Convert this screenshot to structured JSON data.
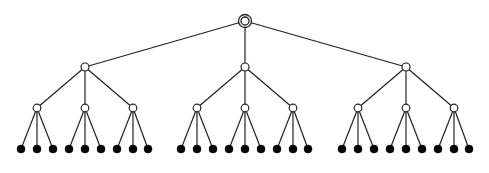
{
  "diagram": {
    "type": "tree",
    "colors": {
      "edge": "#222222",
      "open_node_fill": "#ffffff",
      "open_node_stroke": "#222222",
      "leaf_fill": "#000000",
      "background": "#ffffff"
    },
    "root": {
      "x": 245,
      "y": 21,
      "style": "double-ring"
    },
    "level1": [
      {
        "x": 85,
        "y": 67
      },
      {
        "x": 245,
        "y": 67
      },
      {
        "x": 406,
        "y": 67
      }
    ],
    "level2": [
      {
        "x": 37,
        "y": 108,
        "parent": 0
      },
      {
        "x": 85,
        "y": 108,
        "parent": 0
      },
      {
        "x": 133,
        "y": 108,
        "parent": 0
      },
      {
        "x": 197,
        "y": 108,
        "parent": 1
      },
      {
        "x": 245,
        "y": 108,
        "parent": 1
      },
      {
        "x": 293,
        "y": 108,
        "parent": 1
      },
      {
        "x": 358,
        "y": 108,
        "parent": 2
      },
      {
        "x": 406,
        "y": 108,
        "parent": 2
      },
      {
        "x": 454,
        "y": 108,
        "parent": 2
      }
    ],
    "leaves": [
      {
        "x": 21,
        "y": 149,
        "parent": 0
      },
      {
        "x": 37,
        "y": 149,
        "parent": 0
      },
      {
        "x": 53,
        "y": 149,
        "parent": 0
      },
      {
        "x": 69,
        "y": 149,
        "parent": 1
      },
      {
        "x": 85,
        "y": 149,
        "parent": 1
      },
      {
        "x": 101,
        "y": 149,
        "parent": 1
      },
      {
        "x": 117,
        "y": 149,
        "parent": 2
      },
      {
        "x": 133,
        "y": 149,
        "parent": 2
      },
      {
        "x": 148,
        "y": 149,
        "parent": 2
      },
      {
        "x": 181,
        "y": 149,
        "parent": 3
      },
      {
        "x": 197,
        "y": 149,
        "parent": 3
      },
      {
        "x": 213,
        "y": 149,
        "parent": 3
      },
      {
        "x": 229,
        "y": 149,
        "parent": 4
      },
      {
        "x": 245,
        "y": 149,
        "parent": 4
      },
      {
        "x": 261,
        "y": 149,
        "parent": 4
      },
      {
        "x": 277,
        "y": 149,
        "parent": 5
      },
      {
        "x": 293,
        "y": 149,
        "parent": 5
      },
      {
        "x": 308,
        "y": 149,
        "parent": 5
      },
      {
        "x": 342,
        "y": 149,
        "parent": 6
      },
      {
        "x": 358,
        "y": 149,
        "parent": 6
      },
      {
        "x": 374,
        "y": 149,
        "parent": 6
      },
      {
        "x": 390,
        "y": 149,
        "parent": 7
      },
      {
        "x": 406,
        "y": 149,
        "parent": 7
      },
      {
        "x": 422,
        "y": 149,
        "parent": 7
      },
      {
        "x": 438,
        "y": 149,
        "parent": 8
      },
      {
        "x": 454,
        "y": 149,
        "parent": 8
      },
      {
        "x": 469,
        "y": 149,
        "parent": 8
      }
    ]
  }
}
